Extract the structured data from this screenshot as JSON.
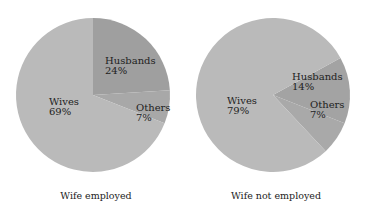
{
  "chart_data": [
    {
      "type": "pie",
      "title": "Wife employed",
      "caption": "Wife employed",
      "center": [
        93,
        95
      ],
      "radius": 77,
      "slices": [
        {
          "label": "Husbands",
          "value": 24,
          "value_label": "24%",
          "color": "#9f9f9f",
          "start_turn": 0.0,
          "end_turn": 0.24,
          "label_pos": [
            105,
            64
          ]
        },
        {
          "label": "Others",
          "value": 7,
          "value_label": "7%",
          "color": "#a8a8a8",
          "start_turn": 0.24,
          "end_turn": 0.31,
          "label_pos": [
            136,
            111
          ]
        },
        {
          "label": "Wives",
          "value": 69,
          "value_label": "69%",
          "color": "#bababa",
          "start_turn": 0.31,
          "end_turn": 1.0,
          "label_pos": [
            49,
            105
          ]
        }
      ]
    },
    {
      "type": "pie",
      "title": "Wife not employed",
      "caption": "Wife not employed",
      "center": [
        273,
        95
      ],
      "radius": 77,
      "slices": [
        {
          "label": "Husbands",
          "value": 14,
          "value_label": "14%",
          "color": "#a3a3a3",
          "start_turn": 0.17,
          "end_turn": 0.31,
          "label_pos": [
            292,
            80
          ]
        },
        {
          "label": "Others",
          "value": 7,
          "value_label": "7%",
          "color": "#a9a9a9",
          "start_turn": 0.31,
          "end_turn": 0.38,
          "label_pos": [
            310,
            108
          ]
        },
        {
          "label": "Wives",
          "value": 79,
          "value_label": "79%",
          "color": "#bababa",
          "start_turn": 0.38,
          "end_turn": 1.17,
          "label_pos": [
            227,
            104
          ]
        }
      ]
    }
  ],
  "captions": {
    "left": "Wife employed",
    "right": "Wife not employed"
  }
}
